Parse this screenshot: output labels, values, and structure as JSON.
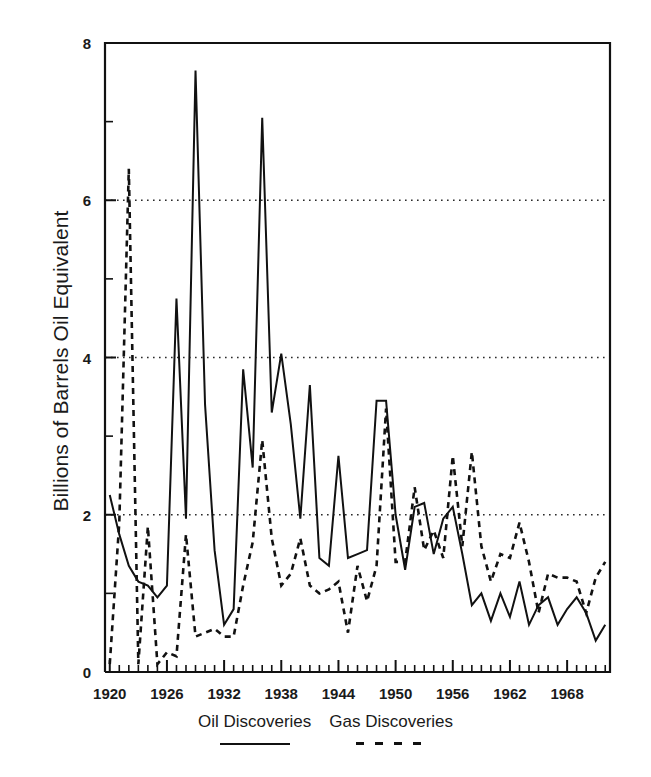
{
  "chart_data": {
    "type": "line",
    "title": "",
    "xlabel": "",
    "ylabel": "Billions of Barrels Oil Equivalent",
    "xlim": [
      1919.5,
      1972.5
    ],
    "ylim": [
      0,
      8
    ],
    "grid": "horizontal dotted gridlines at 2, 4, 6",
    "legend_position": "bottom-center",
    "x_tick_labels": [
      "1920",
      "1926",
      "1932",
      "1938",
      "1944",
      "1950",
      "1956",
      "1962",
      "1968"
    ],
    "x_major_ticks": [
      1920,
      1926,
      1932,
      1938,
      1944,
      1950,
      1956,
      1962,
      1968
    ],
    "y_tick_labels": [
      "0",
      "2",
      "4",
      "6",
      "8"
    ],
    "y_major_ticks": [
      0,
      2,
      4,
      6,
      8
    ],
    "y_minor_ticks": [
      1,
      3,
      5,
      7
    ],
    "x": [
      1920,
      1921,
      1922,
      1923,
      1924,
      1925,
      1926,
      1927,
      1928,
      1929,
      1930,
      1931,
      1932,
      1933,
      1934,
      1935,
      1936,
      1937,
      1938,
      1939,
      1940,
      1941,
      1942,
      1943,
      1944,
      1945,
      1946,
      1947,
      1948,
      1949,
      1950,
      1951,
      1952,
      1953,
      1954,
      1955,
      1956,
      1957,
      1958,
      1959,
      1960,
      1961,
      1962,
      1963,
      1964,
      1965,
      1966,
      1967,
      1968,
      1969,
      1970,
      1971,
      1972
    ],
    "series": [
      {
        "name": "Oil Discoveries",
        "style": "solid",
        "color": "#111111",
        "values": [
          2.25,
          1.75,
          1.35,
          1.15,
          1.1,
          0.95,
          1.1,
          4.75,
          1.95,
          7.65,
          3.4,
          1.55,
          0.6,
          0.8,
          3.85,
          2.6,
          7.05,
          3.3,
          4.05,
          3.15,
          1.95,
          3.65,
          1.45,
          1.35,
          2.75,
          1.45,
          1.5,
          1.55,
          3.45,
          3.45,
          2.0,
          1.3,
          2.1,
          2.15,
          1.5,
          1.95,
          2.1,
          1.5,
          0.85,
          1.0,
          0.65,
          1.0,
          0.7,
          1.15,
          0.6,
          0.85,
          0.95,
          0.6,
          0.8,
          0.95,
          0.75,
          0.4,
          0.6
        ]
      },
      {
        "name": "Gas Discoveries",
        "style": "dashed",
        "color": "#111111",
        "values": [
          0.1,
          1.9,
          6.4,
          0.1,
          1.85,
          0.1,
          0.25,
          0.2,
          1.75,
          0.45,
          0.5,
          0.55,
          0.45,
          0.45,
          1.1,
          1.65,
          2.95,
          1.7,
          1.1,
          1.25,
          1.7,
          1.1,
          1.0,
          1.05,
          1.15,
          0.5,
          1.35,
          0.9,
          1.35,
          3.35,
          1.4,
          1.4,
          2.35,
          1.55,
          1.8,
          1.45,
          2.75,
          1.6,
          2.8,
          1.6,
          1.15,
          1.5,
          1.45,
          1.9,
          1.4,
          0.75,
          1.25,
          1.2,
          1.2,
          1.15,
          0.75,
          1.2,
          1.4
        ]
      }
    ]
  },
  "axes": {
    "y_axis_title": "Billions of Barrels Oil Equivalent"
  },
  "legend": {
    "entries": [
      {
        "label": "Oil Discoveries",
        "style": "solid"
      },
      {
        "label": "Gas Discoveries",
        "style": "dashed"
      }
    ]
  }
}
